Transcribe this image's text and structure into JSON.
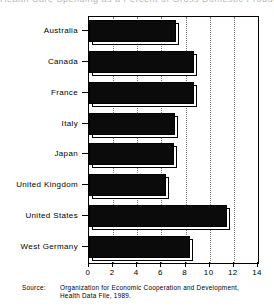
{
  "top_remnant": "Health Care Spending as a Percent of Gross Domestic Product, 1989",
  "source": {
    "label": "Source:",
    "text": "Organization for Economic Cooperation and Development, Health Data File, 1989."
  },
  "axis": {
    "x_ticks": [
      "0",
      "2",
      "4",
      "6",
      "8",
      "10",
      "12",
      "14"
    ],
    "x_min": 0,
    "x_max": 14
  },
  "chart_data": {
    "type": "bar",
    "orientation": "horizontal",
    "title": "",
    "xlabel": "",
    "ylabel": "",
    "xlim": [
      0,
      14
    ],
    "grid": true,
    "legend": "none",
    "bar_color": "#0b0b0b",
    "categories": [
      "Australia",
      "Canada",
      "France",
      "Italy",
      "Japan",
      "United Kingdom",
      "United States",
      "West Germany"
    ],
    "values": [
      7.2,
      8.7,
      8.7,
      7.1,
      7.0,
      6.4,
      11.4,
      8.4
    ],
    "tick_labels": [
      "0",
      "2",
      "4",
      "6",
      "8",
      "10",
      "12",
      "14"
    ],
    "source_note": "Source: Organization for Economic Cooperation and Development, Health Data File, 1989."
  }
}
